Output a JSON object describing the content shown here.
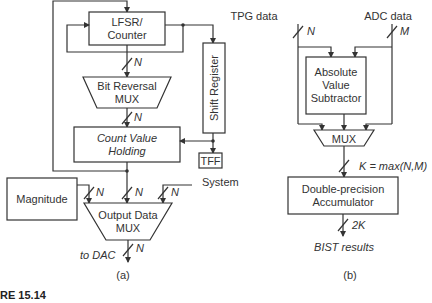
{
  "figure": {
    "caption_fragment": "RE 15.14",
    "panel_a": {
      "label": "(a)",
      "blocks": {
        "lfsr": [
          "LFSR/",
          "Counter"
        ],
        "bit_reversal_mux": [
          "Bit Reversal",
          "MUX"
        ],
        "count_value_holding": [
          "Count Value",
          "Holding"
        ],
        "shift_register": "Shift Register",
        "tff": "TFF",
        "magnitude": "Magnitude",
        "output_data_mux": [
          "Output Data",
          "MUX"
        ]
      },
      "signals": {
        "system": "System",
        "to_dac": "to DAC",
        "bus_width": "N"
      }
    },
    "panel_b": {
      "label": "(b)",
      "inputs": {
        "tpg": "TPG data",
        "tpg_width": "N",
        "adc": "ADC data",
        "adc_width": "M"
      },
      "blocks": {
        "abs_subtractor": [
          "Absolute",
          "Value",
          "Subtractor"
        ],
        "mux": "MUX",
        "accumulator": [
          "Double-precision",
          "Accumulator"
        ]
      },
      "signals": {
        "k_width": "K = max(N,M)",
        "out_width": "2K",
        "output": "BIST results"
      }
    }
  }
}
